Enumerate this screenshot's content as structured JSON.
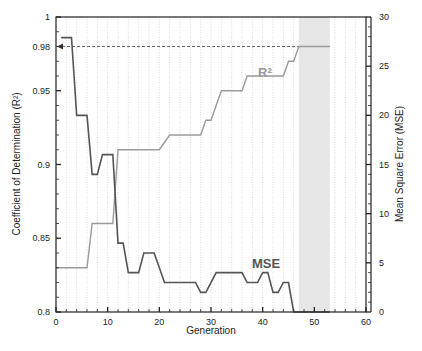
{
  "chart_data": {
    "type": "line",
    "title": "",
    "xlabel": "Generation",
    "ylabel_left": "Coefficient of Determination (R²)",
    "ylabel_right": "Mean Square Error (MSE)",
    "xlim": [
      0,
      60
    ],
    "ylim_left": [
      0.8,
      1.0
    ],
    "ylim_right": [
      0,
      30
    ],
    "x_ticks": [
      "0",
      "10",
      "20",
      "30",
      "40",
      "50",
      "60"
    ],
    "y_ticks_left": [
      "0.8",
      "0.85",
      "0.9",
      "0.95",
      "0.98",
      "1"
    ],
    "y_ticks_right": [
      "0",
      "5",
      "10",
      "15",
      "20",
      "25",
      "30"
    ],
    "grid": "vertical dotted lines every 2 generations",
    "shaded_region": {
      "x_start": 47,
      "x_end": 53,
      "color": "#e6e6e6"
    },
    "reference_line": {
      "axis": "left",
      "value": 0.98,
      "style": "dashed",
      "x_start": 0,
      "x_end": 53,
      "arrow_toward": "left axis"
    },
    "series": [
      {
        "name": "MSE",
        "axis": "right",
        "color": "#555555",
        "label": "MSE",
        "step_points": [
          [
            1,
            27.9
          ],
          [
            3,
            27.9
          ],
          [
            4,
            20.0
          ],
          [
            6,
            20.0
          ],
          [
            7,
            14.0
          ],
          [
            8,
            14.0
          ],
          [
            9,
            16.0
          ],
          [
            11,
            16.0
          ],
          [
            12,
            7.0
          ],
          [
            13,
            7.0
          ],
          [
            14,
            4.0
          ],
          [
            16,
            4.0
          ],
          [
            17,
            6.0
          ],
          [
            19,
            6.0
          ],
          [
            21,
            3.0
          ],
          [
            27,
            3.0
          ],
          [
            28,
            2.0
          ],
          [
            29,
            2.0
          ],
          [
            31,
            4.0
          ],
          [
            36,
            4.0
          ],
          [
            37,
            3.0
          ],
          [
            39,
            3.0
          ],
          [
            40,
            4.0
          ],
          [
            41,
            4.0
          ],
          [
            42,
            2.0
          ],
          [
            43,
            2.0
          ],
          [
            44,
            3.0
          ],
          [
            45,
            3.0
          ],
          [
            46,
            0.0
          ],
          [
            47,
            0.0
          ],
          [
            53,
            0.0
          ]
        ]
      },
      {
        "name": "R²",
        "axis": "left",
        "color": "#999999",
        "label": "R²",
        "step_points": [
          [
            0,
            0.83
          ],
          [
            6,
            0.83
          ],
          [
            7,
            0.86
          ],
          [
            11,
            0.86
          ],
          [
            12,
            0.91
          ],
          [
            20,
            0.91
          ],
          [
            22,
            0.92
          ],
          [
            28,
            0.92
          ],
          [
            29,
            0.93
          ],
          [
            30,
            0.93
          ],
          [
            32,
            0.95
          ],
          [
            36,
            0.95
          ],
          [
            37,
            0.96
          ],
          [
            44,
            0.96
          ],
          [
            45,
            0.97
          ],
          [
            46,
            0.97
          ],
          [
            47,
            0.98
          ],
          [
            53,
            0.98
          ]
        ]
      }
    ]
  },
  "labels": {
    "x_axis_title": "Generation",
    "left_axis_title": "Coefficient of Determination (R²)",
    "right_axis_title": "Mean Square Error (MSE)",
    "mse_label": "MSE",
    "r2_label": "R²"
  }
}
